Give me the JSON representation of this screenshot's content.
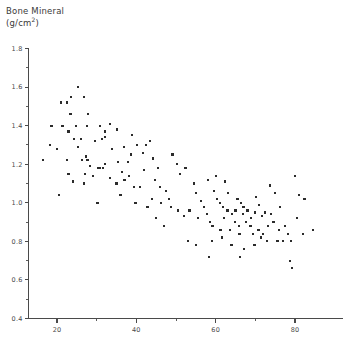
{
  "chart_data": {
    "type": "scatter",
    "title": "Bone Mineral",
    "title_line1": "Bone Mineral",
    "title_line2_prefix": "(g/cm",
    "title_line2_sup": "2",
    "title_line2_suffix": ")",
    "xlabel": "",
    "ylabel": "Bone Mineral (g/cm2)",
    "xlim": [
      15,
      86
    ],
    "ylim": [
      0.4,
      1.8
    ],
    "grid": false,
    "legend": "none",
    "x_ticks_major": [
      20,
      40,
      60,
      80
    ],
    "x_ticks_minor": [
      30,
      50,
      70
    ],
    "y_ticks_major": [
      0.4,
      0.6,
      0.8,
      1.0,
      1.2,
      1.4,
      1.6,
      1.8
    ],
    "y_ticks_minor": [
      0.5,
      0.7,
      0.9,
      1.1,
      1.3,
      1.5,
      1.7
    ],
    "x_tick_labels": [
      "20",
      "40",
      "60",
      "80"
    ],
    "y_tick_labels": [
      "0.4",
      "0.6",
      "0.8",
      "1.0",
      "1.2",
      "1.4",
      "1.6",
      "1.8"
    ],
    "marker": "square",
    "marker_size_px": 2.2,
    "marker_color": "#2b2b2b",
    "points": [
      [
        25.2,
        1.6
      ],
      [
        23.5,
        1.55
      ],
      [
        21.0,
        1.52
      ],
      [
        22.5,
        1.52
      ],
      [
        26.8,
        1.55
      ],
      [
        23.4,
        1.46
      ],
      [
        27.8,
        1.46
      ],
      [
        18.6,
        1.4
      ],
      [
        21.4,
        1.4
      ],
      [
        24.8,
        1.4
      ],
      [
        27.6,
        1.4
      ],
      [
        30.9,
        1.4
      ],
      [
        33.4,
        1.41
      ],
      [
        22.9,
        1.37
      ],
      [
        32.0,
        1.37
      ],
      [
        24.2,
        1.33
      ],
      [
        26.0,
        1.33
      ],
      [
        29.5,
        1.32
      ],
      [
        31.3,
        1.33
      ],
      [
        32.1,
        1.34
      ],
      [
        18.3,
        1.3
      ],
      [
        20.0,
        1.28
      ],
      [
        25.3,
        1.29
      ],
      [
        33.9,
        1.28
      ],
      [
        27.4,
        1.24
      ],
      [
        16.5,
        1.22
      ],
      [
        22.6,
        1.22
      ],
      [
        26.4,
        1.22
      ],
      [
        27.7,
        1.22
      ],
      [
        32.2,
        1.2
      ],
      [
        28.3,
        1.19
      ],
      [
        30.4,
        1.18
      ],
      [
        30.8,
        1.18
      ],
      [
        31.5,
        1.18
      ],
      [
        22.9,
        1.15
      ],
      [
        27.0,
        1.15
      ],
      [
        29.0,
        1.14
      ],
      [
        33.3,
        1.13
      ],
      [
        24.0,
        1.11
      ],
      [
        26.8,
        1.1
      ],
      [
        35.0,
        1.1
      ],
      [
        20.5,
        1.04
      ],
      [
        30.2,
        1.0
      ],
      [
        35.3,
        1.21
      ],
      [
        37.8,
        1.21
      ],
      [
        36.4,
        1.16
      ],
      [
        37.0,
        1.12
      ],
      [
        38.2,
        1.14
      ],
      [
        39.4,
        1.08
      ],
      [
        41.0,
        1.08
      ],
      [
        42.0,
        1.17
      ],
      [
        40.1,
        1.3
      ],
      [
        42.5,
        1.3
      ],
      [
        39.0,
        1.35
      ],
      [
        35.2,
        1.38
      ],
      [
        44.2,
        1.23
      ],
      [
        45.4,
        1.18
      ],
      [
        44.7,
        1.12
      ],
      [
        46.0,
        1.08
      ],
      [
        47.5,
        1.06
      ],
      [
        44.0,
        1.02
      ],
      [
        46.3,
        1.0
      ],
      [
        48.2,
        1.02
      ],
      [
        49.1,
        1.25
      ],
      [
        50.2,
        1.2
      ],
      [
        51.0,
        1.15
      ],
      [
        52.4,
        1.18
      ],
      [
        48.8,
        0.98
      ],
      [
        50.6,
        0.96
      ],
      [
        52.0,
        0.93
      ],
      [
        53.4,
        0.96
      ],
      [
        47.0,
        0.88
      ],
      [
        54.5,
        1.1
      ],
      [
        55.1,
        1.05
      ],
      [
        56.4,
        1.01
      ],
      [
        57.0,
        0.98
      ],
      [
        55.6,
        0.92
      ],
      [
        57.8,
        0.94
      ],
      [
        58.6,
        0.9
      ],
      [
        59.5,
        1.06
      ],
      [
        60.3,
        1.02
      ],
      [
        61.0,
        1.0
      ],
      [
        58.0,
        1.12
      ],
      [
        60.0,
        1.14
      ],
      [
        62.4,
        1.11
      ],
      [
        63.2,
        1.05
      ],
      [
        61.8,
        0.98
      ],
      [
        63.0,
        0.96
      ],
      [
        64.2,
        0.94
      ],
      [
        62.0,
        0.92
      ],
      [
        64.8,
        0.9
      ],
      [
        59.2,
        0.88
      ],
      [
        61.2,
        0.86
      ],
      [
        63.6,
        0.86
      ],
      [
        65.5,
        1.02
      ],
      [
        66.4,
        1.0
      ],
      [
        67.0,
        0.98
      ],
      [
        65.0,
        0.96
      ],
      [
        66.8,
        0.94
      ],
      [
        68.0,
        0.96
      ],
      [
        67.6,
        0.9
      ],
      [
        65.8,
        0.88
      ],
      [
        68.8,
        0.88
      ],
      [
        66.0,
        0.84
      ],
      [
        69.4,
        0.84
      ],
      [
        70.2,
        1.03
      ],
      [
        71.0,
        0.99
      ],
      [
        70.0,
        0.95
      ],
      [
        71.6,
        0.93
      ],
      [
        69.0,
        0.92
      ],
      [
        72.4,
        0.95
      ],
      [
        70.8,
        0.86
      ],
      [
        72.0,
        0.84
      ],
      [
        73.2,
        0.88
      ],
      [
        74.0,
        0.94
      ],
      [
        73.6,
        1.09
      ],
      [
        75.0,
        1.05
      ],
      [
        76.2,
        0.98
      ],
      [
        74.6,
        0.9
      ],
      [
        76.0,
        0.86
      ],
      [
        77.4,
        0.88
      ],
      [
        78.2,
        0.84
      ],
      [
        75.6,
        0.8
      ],
      [
        77.0,
        0.8
      ],
      [
        58.4,
        0.72
      ],
      [
        59.0,
        0.8
      ],
      [
        61.6,
        0.82
      ],
      [
        64.0,
        0.78
      ],
      [
        67.2,
        0.76
      ],
      [
        69.8,
        0.78
      ],
      [
        66.2,
        0.72
      ],
      [
        71.4,
        0.82
      ],
      [
        73.0,
        0.8
      ],
      [
        80.0,
        1.14
      ],
      [
        81.0,
        1.04
      ],
      [
        82.4,
        1.02
      ],
      [
        80.6,
        0.92
      ],
      [
        82.0,
        0.84
      ],
      [
        84.6,
        0.86
      ],
      [
        79.0,
        0.8
      ],
      [
        78.8,
        0.7
      ],
      [
        79.2,
        0.66
      ],
      [
        53.0,
        0.8
      ],
      [
        55.0,
        0.78
      ],
      [
        45.0,
        0.92
      ],
      [
        42.8,
        0.98
      ],
      [
        39.8,
        1.0
      ],
      [
        36.0,
        1.04
      ],
      [
        38.6,
        1.25
      ],
      [
        41.6,
        1.26
      ],
      [
        43.4,
        1.32
      ],
      [
        36.8,
        1.29
      ]
    ]
  }
}
